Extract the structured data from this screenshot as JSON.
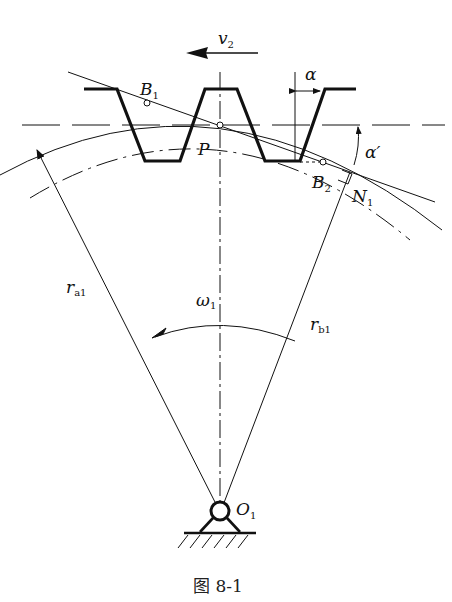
{
  "figure": {
    "caption": "图 8-1",
    "type": "gear-rack meshing diagram"
  },
  "labels": {
    "v": "v",
    "v_sub": "2",
    "B1": "B",
    "B1_sub": "1",
    "B2": "B",
    "B2_sub": "2",
    "P": "P",
    "alpha": "α",
    "alpha_prime": "α′",
    "N": "N",
    "N_sub": "1",
    "ra": "r",
    "ra_sub": "a1",
    "rb": "r",
    "rb_sub": "b1",
    "omega": "ω",
    "omega_sub": "1",
    "O": "O",
    "O_sub": "1"
  },
  "colors": {
    "stroke": "#111111",
    "background": "#ffffff"
  }
}
